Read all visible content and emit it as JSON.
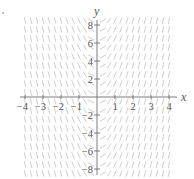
{
  "chart_data": {
    "type": "slope_field",
    "title": "",
    "xlabel": "x",
    "ylabel": "y",
    "xlim": [
      -4,
      4
    ],
    "ylim": [
      -8,
      8
    ],
    "grid": false,
    "x_ticks": [
      -4,
      -3,
      -2,
      -1,
      1,
      2,
      3,
      4
    ],
    "x_tick_labels": [
      "−4",
      "−3",
      "−2",
      "−1",
      "1",
      "2",
      "3",
      "4"
    ],
    "y_ticks": [
      -8,
      -6,
      -4,
      -2,
      2,
      4,
      6,
      8
    ],
    "y_tick_labels": [
      "−8",
      "−6",
      "−4",
      "−2",
      "2",
      "4",
      "6",
      "8"
    ],
    "field_description": "Slope depends only on x; odd in x: negative slopes for x<0, positive for x>0, shallow near x=0 and nearly vertical near |x|=4",
    "x_samples": [
      -4,
      -3.67,
      -3.33,
      -3,
      -2.67,
      -2.33,
      -2,
      -1.67,
      -1.33,
      -1,
      -0.67,
      -0.33,
      0.33,
      0.67,
      1,
      1.33,
      1.67,
      2,
      2.33,
      2.67,
      3,
      3.33,
      3.67,
      4
    ],
    "slopes": [
      -9.5,
      -9.0,
      -8.5,
      -8.0,
      -7.5,
      -7.0,
      -6.5,
      -6.0,
      -5.2,
      -4.2,
      -3.2,
      -1.2,
      1.2,
      3.2,
      4.2,
      5.2,
      6.0,
      6.5,
      7.0,
      7.5,
      8.0,
      8.5,
      9.0,
      9.5
    ],
    "y_samples_step": 1,
    "segment_color": "#c8c8c8",
    "axis_color": "#6e6e6e"
  },
  "layout": {
    "origin_px": [
      97,
      97
    ],
    "px_per_x_unit": 18,
    "px_per_y_unit": 9,
    "segment_length_px": 6,
    "field_y_range": [
      -8.5,
      8.5
    ]
  },
  "labels": {
    "x_axis": "x",
    "y_axis": "y",
    "stray_mark": "."
  }
}
